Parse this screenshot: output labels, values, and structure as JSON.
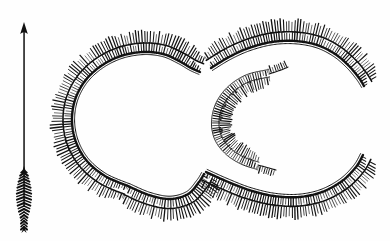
{
  "figure": {
    "kind": "hachured-earthwork-plan",
    "caption_visible": false,
    "background_color": "#fefefe",
    "ink_color": "#111111",
    "width": 390,
    "height": 241
  },
  "north_arrow": {
    "label": "N",
    "icon": "north-arrow-icon",
    "direction": "up",
    "tip_x": 24,
    "tip_y": 24,
    "tail_x": 24,
    "tail_y": 232,
    "style": "feathered-fletching-arrow"
  },
  "chart_data": {
    "type": "line",
    "title": "",
    "xlabel": "",
    "ylabel": "",
    "grid": false,
    "legend": null,
    "xlim": [
      0,
      390
    ],
    "ylim": [
      241,
      0
    ],
    "annotations": [
      "N"
    ],
    "series": [
      {
        "name": "outer-rampart-crest-west-lobe",
        "role": "bank-crest",
        "hachure_side": "outward",
        "closed": false,
        "points": [
          [
            128,
            186
          ],
          [
            105,
            176
          ],
          [
            87,
            161
          ],
          [
            76,
            142
          ],
          [
            72,
            121
          ],
          [
            75,
            100
          ],
          [
            85,
            81
          ],
          [
            101,
            66
          ],
          [
            121,
            56
          ],
          [
            143,
            52
          ],
          [
            163,
            54
          ],
          [
            179,
            61
          ],
          [
            191,
            68
          ],
          [
            200,
            72
          ]
        ]
      },
      {
        "name": "outer-rampart-crest-east-lobe",
        "role": "bank-crest",
        "hachure_side": "outward",
        "closed": false,
        "points": [
          [
            211,
            68
          ],
          [
            229,
            57
          ],
          [
            249,
            48
          ],
          [
            272,
            42
          ],
          [
            295,
            41
          ],
          [
            317,
            45
          ],
          [
            335,
            54
          ],
          [
            349,
            66
          ],
          [
            359,
            78
          ],
          [
            364,
            86
          ]
        ]
      },
      {
        "name": "outer-rampart-crest-south-east",
        "role": "bank-crest",
        "hachure_side": "outward",
        "closed": false,
        "points": [
          [
            206,
            172
          ],
          [
            226,
            181
          ],
          [
            249,
            190
          ],
          [
            274,
            196
          ],
          [
            299,
            197
          ],
          [
            322,
            192
          ],
          [
            342,
            181
          ],
          [
            356,
            167
          ],
          [
            363,
            155
          ]
        ]
      },
      {
        "name": "outer-rampart-crest-south-west",
        "role": "bank-crest",
        "hachure_side": "outward",
        "closed": false,
        "points": [
          [
            128,
            186
          ],
          [
            149,
            195
          ],
          [
            170,
            199
          ],
          [
            188,
            194
          ],
          [
            199,
            182
          ],
          [
            204,
            174
          ]
        ]
      },
      {
        "name": "inner-arc-crest",
        "role": "inner-bank-crest",
        "hachure_side": "outward-left",
        "closed": false,
        "points": [
          [
            269,
            74
          ],
          [
            248,
            79
          ],
          [
            231,
            90
          ],
          [
            220,
            105
          ],
          [
            216,
            122
          ],
          [
            219,
            138
          ],
          [
            229,
            151
          ],
          [
            243,
            160
          ],
          [
            258,
            165
          ]
        ]
      },
      {
        "name": "inner-arc-tail-upper",
        "role": "bank-terminal",
        "points": [
          [
            269,
            74
          ],
          [
            281,
            70
          ],
          [
            288,
            67
          ]
        ]
      },
      {
        "name": "inner-arc-tail-lower",
        "role": "bank-terminal",
        "points": [
          [
            258,
            165
          ],
          [
            269,
            168
          ],
          [
            276,
            170
          ]
        ]
      }
    ]
  },
  "accessibility": {
    "figure_description": "Plan of a double-ditched earthwork enclosure drawn with hachures, comprising a large outer C-shaped rampart open to the east and a smaller inner C-shaped rampart, with a north arrow at the left."
  }
}
